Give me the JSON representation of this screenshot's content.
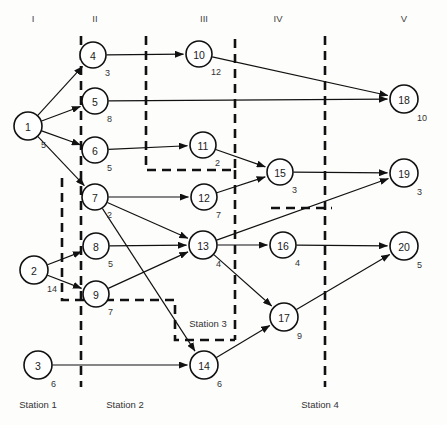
{
  "diagram": {
    "type": "precedence-network",
    "width": 447,
    "height": 425,
    "column_headers": [
      {
        "label": "I",
        "x": 33,
        "y": 22
      },
      {
        "label": "II",
        "x": 95,
        "y": 22
      },
      {
        "label": "III",
        "x": 204,
        "y": 22
      },
      {
        "label": "IV",
        "x": 278,
        "y": 22
      },
      {
        "label": "V",
        "x": 404,
        "y": 22
      }
    ],
    "nodes": [
      {
        "id": "1",
        "label": "1",
        "duration": "5",
        "x": 28,
        "y": 126,
        "r": 14
      },
      {
        "id": "2",
        "label": "2",
        "duration": "14",
        "x": 34,
        "y": 270,
        "r": 14
      },
      {
        "id": "3",
        "label": "3",
        "duration": "6",
        "x": 38,
        "y": 365,
        "r": 14
      },
      {
        "id": "4",
        "label": "4",
        "duration": "3",
        "x": 93,
        "y": 55,
        "r": 13
      },
      {
        "id": "5",
        "label": "5",
        "duration": "8",
        "x": 95,
        "y": 101,
        "r": 13
      },
      {
        "id": "6",
        "label": "6",
        "duration": "5",
        "x": 95,
        "y": 150,
        "r": 13
      },
      {
        "id": "7",
        "label": "7",
        "duration": "2",
        "x": 95,
        "y": 197,
        "r": 13
      },
      {
        "id": "8",
        "label": "8",
        "duration": "5",
        "x": 96,
        "y": 246,
        "r": 13
      },
      {
        "id": "9",
        "label": "9",
        "duration": "7",
        "x": 96,
        "y": 294,
        "r": 13
      },
      {
        "id": "10",
        "label": "10",
        "duration": "12",
        "x": 199,
        "y": 54,
        "r": 13
      },
      {
        "id": "11",
        "label": "11",
        "duration": "2",
        "x": 203,
        "y": 145,
        "r": 13
      },
      {
        "id": "12",
        "label": "12",
        "duration": "7",
        "x": 204,
        "y": 197,
        "r": 13
      },
      {
        "id": "13",
        "label": "13",
        "duration": "4",
        "x": 203,
        "y": 245,
        "r": 14
      },
      {
        "id": "14",
        "label": "14",
        "duration": "6",
        "x": 204,
        "y": 365,
        "r": 14
      },
      {
        "id": "15",
        "label": "15",
        "duration": "3",
        "x": 280,
        "y": 172,
        "r": 13
      },
      {
        "id": "16",
        "label": "16",
        "duration": "4",
        "x": 283,
        "y": 245,
        "r": 13
      },
      {
        "id": "17",
        "label": "17",
        "duration": "9",
        "x": 284,
        "y": 317,
        "r": 14
      },
      {
        "id": "18",
        "label": "18",
        "duration": "10",
        "x": 404,
        "y": 99,
        "r": 14
      },
      {
        "id": "19",
        "label": "19",
        "duration": "3",
        "x": 404,
        "y": 173,
        "r": 14
      },
      {
        "id": "20",
        "label": "20",
        "duration": "5",
        "x": 404,
        "y": 246,
        "r": 14
      }
    ],
    "edges": [
      {
        "from": "1",
        "to": "4"
      },
      {
        "from": "1",
        "to": "5"
      },
      {
        "from": "1",
        "to": "6"
      },
      {
        "from": "1",
        "to": "7"
      },
      {
        "from": "2",
        "to": "8"
      },
      {
        "from": "2",
        "to": "9"
      },
      {
        "from": "3",
        "to": "14"
      },
      {
        "from": "4",
        "to": "10"
      },
      {
        "from": "5",
        "to": "18"
      },
      {
        "from": "6",
        "to": "11"
      },
      {
        "from": "7",
        "to": "12"
      },
      {
        "from": "7",
        "to": "13"
      },
      {
        "from": "7",
        "to": "14"
      },
      {
        "from": "8",
        "to": "13"
      },
      {
        "from": "9",
        "to": "13"
      },
      {
        "from": "10",
        "to": "18"
      },
      {
        "from": "11",
        "to": "15"
      },
      {
        "from": "12",
        "to": "15"
      },
      {
        "from": "13",
        "to": "16"
      },
      {
        "from": "13",
        "to": "17"
      },
      {
        "from": "13",
        "to": "19"
      },
      {
        "from": "14",
        "to": "17"
      },
      {
        "from": "15",
        "to": "19"
      },
      {
        "from": "16",
        "to": "20"
      },
      {
        "from": "17",
        "to": "20"
      }
    ],
    "zones": [
      {
        "name": "station-1-boundary",
        "points": "81,36 81,387"
      },
      {
        "name": "station-2-boundary-upper",
        "points": "146,36 146,170 235,170 235,36"
      },
      {
        "name": "station-2-boundary-lower",
        "points": "62,178 62,300 175,300 175,340 235,340"
      },
      {
        "name": "station-3-boundary",
        "points": "235,170 235,340"
      },
      {
        "name": "station-4-boundary",
        "points": "325,36 325,387"
      },
      {
        "name": "station-3-upper-tail",
        "points": "271,208 332,208"
      }
    ],
    "zone_labels": [
      {
        "label": "Station 3",
        "x": 208,
        "y": 327
      }
    ],
    "station_labels": [
      {
        "label": "Station 1",
        "x": 38,
        "y": 408
      },
      {
        "label": "Station 2",
        "x": 125,
        "y": 408
      },
      {
        "label": "Station 4",
        "x": 320,
        "y": 408
      }
    ]
  },
  "colors": {
    "stroke": "#111111",
    "background": "#fdfdfc",
    "text": "#333333"
  }
}
